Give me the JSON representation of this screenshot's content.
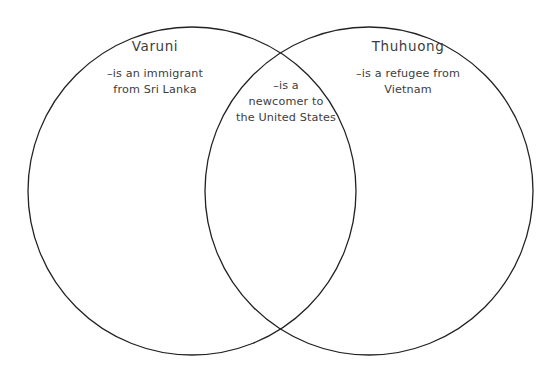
{
  "diagram": {
    "type": "venn-two-circle",
    "background_color": "#ffffff",
    "stroke_color": "#222222",
    "text_color": "#3d3d3d",
    "left_circle": {
      "title": "Varuni",
      "center_x": 192,
      "center_y": 191,
      "radius": 164
    },
    "right_circle": {
      "title": "Thuhuong",
      "center_x": 369,
      "center_y": 191,
      "radius": 164
    },
    "left_only": {
      "label": "Varuni",
      "lines": [
        "–is an immigrant",
        "from Sri Lanka"
      ]
    },
    "overlap": {
      "lines": [
        "–is a",
        "newcomer to",
        "the United States"
      ]
    },
    "right_only": {
      "label": "Thuhuong",
      "lines": [
        "–is a refugee from",
        "Vietnam"
      ]
    }
  }
}
